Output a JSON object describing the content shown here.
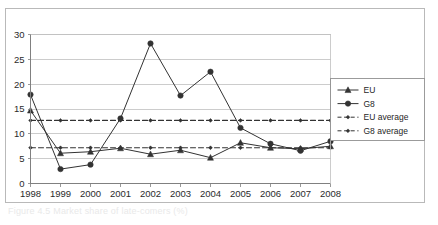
{
  "figure": {
    "caption": "Figure 4.5 Market share of late-comers (%)"
  },
  "chart_data": {
    "type": "line",
    "title": "",
    "xlabel": "",
    "ylabel": "",
    "categories": [
      "1998",
      "1999",
      "2000",
      "2001",
      "2002",
      "2003",
      "2004",
      "2005",
      "2006",
      "2007",
      "2008"
    ],
    "x_tick_labels": [
      "1998",
      "1999",
      "2000",
      "2001",
      "2002",
      "2003",
      "2004",
      "2005",
      "2006",
      "2007",
      "2008"
    ],
    "y_tick_labels": [
      "0",
      "5",
      "10",
      "15",
      "20",
      "25",
      "30"
    ],
    "y_ticks": [
      0,
      5,
      10,
      15,
      20,
      25,
      30
    ],
    "ylim": [
      0,
      30
    ],
    "grid": "horizontal",
    "legend_position": "right",
    "series": [
      {
        "name": "EU",
        "marker": "triangle",
        "line_style": "solid",
        "color": "#333333",
        "values": [
          14.7,
          6.1,
          6.4,
          7.1,
          5.9,
          6.7,
          5.2,
          8.2,
          7.2,
          7.0,
          7.5
        ]
      },
      {
        "name": "G8",
        "marker": "circle",
        "line_style": "solid",
        "color": "#333333",
        "values": [
          17.9,
          2.9,
          3.8,
          13.1,
          28.2,
          17.7,
          22.5,
          11.2,
          8.0,
          6.6,
          8.5
        ]
      },
      {
        "name": "EU average",
        "marker": "small-dot",
        "line_style": "dashed",
        "color": "#333333",
        "constant": 7.2,
        "values": [
          7.2,
          7.2,
          7.2,
          7.2,
          7.2,
          7.2,
          7.2,
          7.2,
          7.2,
          7.2,
          7.2
        ]
      },
      {
        "name": "G8 average",
        "marker": "small-dot",
        "line_style": "dashed",
        "color": "#333333",
        "constant": 12.7,
        "values": [
          12.7,
          12.7,
          12.7,
          12.7,
          12.7,
          12.7,
          12.7,
          12.7,
          12.7,
          12.7,
          12.7
        ]
      }
    ],
    "legend_entries": [
      "EU",
      "G8",
      "EU average",
      "G8 average"
    ],
    "colors": {
      "axis": "#808080",
      "grid": "#bfbfbf",
      "series": "#333333",
      "frame": "#b9b9b9",
      "text": "#2b2b2b"
    }
  }
}
